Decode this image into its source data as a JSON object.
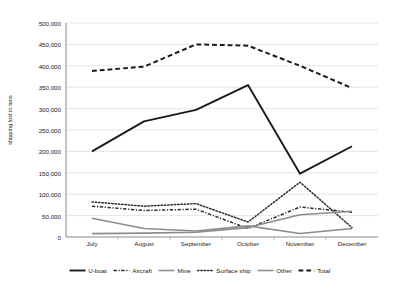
{
  "chart_data": {
    "type": "line",
    "title": "",
    "xlabel": "",
    "ylabel": "shipping lost in tons",
    "categories": [
      "July",
      "August",
      "September",
      "October",
      "November",
      "December"
    ],
    "ylim": [
      0,
      500000
    ],
    "ytick_labels": [
      "0",
      "50,000",
      "100,000",
      "150,000",
      "200,000",
      "250,000",
      "300,000",
      "350,000",
      "400,000",
      "450,000",
      "500,000"
    ],
    "ytick_values": [
      0,
      50000,
      100000,
      150000,
      200000,
      250000,
      300000,
      350000,
      400000,
      450000,
      500000
    ],
    "grid": true,
    "legend_position": "bottom",
    "series": [
      {
        "name": "U-boat",
        "values": [
          200000,
          270000,
          297000,
          355000,
          148000,
          212000
        ],
        "color": "#1a1a1a",
        "style": "solid",
        "width": 1.9
      },
      {
        "name": "Aircraft",
        "values": [
          72000,
          62000,
          65000,
          20000,
          70000,
          58000
        ],
        "color": "#2b2b2b",
        "style": "dashdot",
        "width": 1.5
      },
      {
        "name": "Mine",
        "values": [
          44000,
          20000,
          14000,
          26000,
          8000,
          20000
        ],
        "color": "#8c8c8c",
        "style": "solid",
        "width": 1.6
      },
      {
        "name": "Surface ship",
        "values": [
          82000,
          72000,
          78000,
          35000,
          128000,
          22000
        ],
        "color": "#2b2b2b",
        "style": "dotted",
        "width": 1.5
      },
      {
        "name": "Other",
        "values": [
          8000,
          9000,
          11000,
          22000,
          52000,
          60000
        ],
        "color": "#8c8c8c",
        "style": "solid",
        "width": 1.6
      },
      {
        "name": "Total",
        "values": [
          388000,
          398000,
          450000,
          447000,
          400000,
          348000
        ],
        "color": "#1a1a1a",
        "style": "dashed",
        "width": 2.0
      }
    ]
  },
  "axis": {
    "y_title": "shipping lost in tons"
  }
}
